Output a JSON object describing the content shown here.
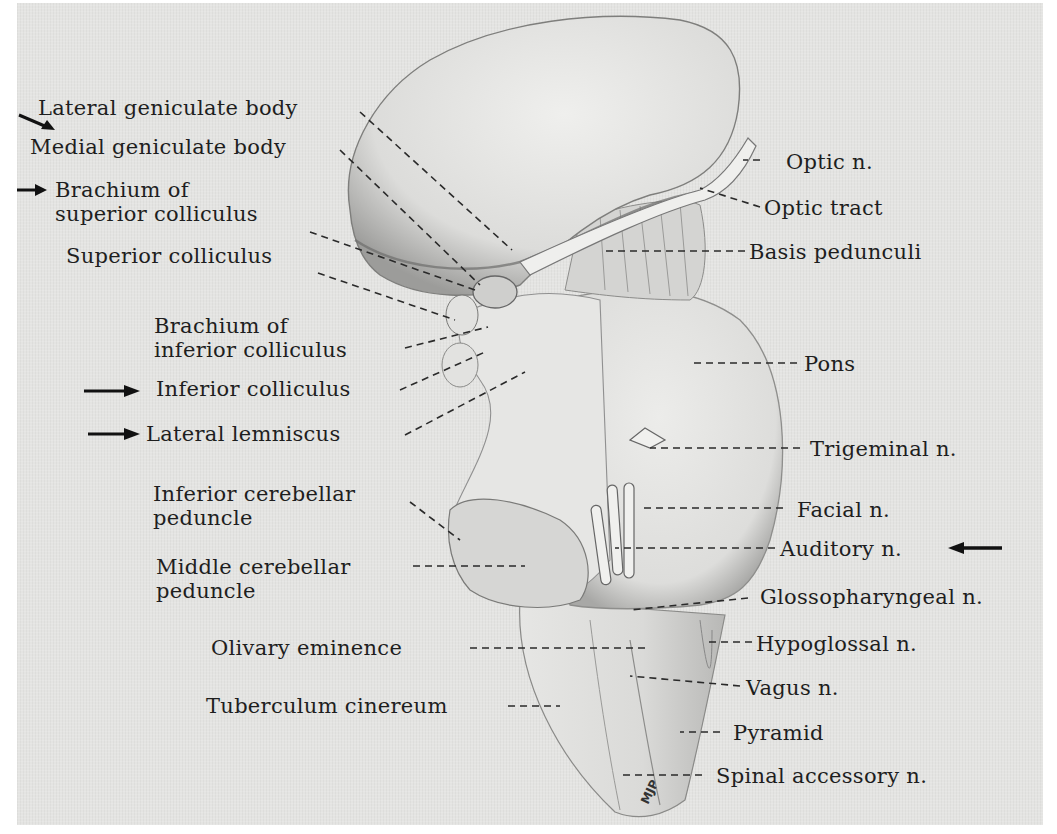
{
  "figure": {
    "signature": "MJP",
    "background_color": "#e4e4e2",
    "ink_color": "#1e1e1e"
  },
  "labels_left": [
    {
      "id": "lateral-geniculate-body",
      "lines": [
        "Lateral geniculate body"
      ],
      "arrow": true
    },
    {
      "id": "medial-geniculate-body",
      "lines": [
        "Medial geniculate body"
      ],
      "arrow": false
    },
    {
      "id": "brachium-superior-colliculus",
      "lines": [
        "Brachium of",
        "superior colliculus"
      ],
      "arrow": true
    },
    {
      "id": "superior-colliculus",
      "lines": [
        "Superior colliculus"
      ],
      "arrow": false
    },
    {
      "id": "brachium-inferior-colliculus",
      "lines": [
        "Brachium of",
        "inferior colliculus"
      ],
      "arrow": false
    },
    {
      "id": "inferior-colliculus",
      "lines": [
        "Inferior colliculus"
      ],
      "arrow": true
    },
    {
      "id": "lateral-lemniscus",
      "lines": [
        "Lateral lemniscus"
      ],
      "arrow": true
    },
    {
      "id": "inferior-cerebellar-peduncle",
      "lines": [
        "Inferior cerebellar",
        "peduncle"
      ],
      "arrow": false
    },
    {
      "id": "middle-cerebellar-peduncle",
      "lines": [
        "Middle cerebellar",
        "peduncle"
      ],
      "arrow": false
    },
    {
      "id": "olivary-eminence",
      "lines": [
        "Olivary eminence"
      ],
      "arrow": false
    },
    {
      "id": "tuberculum-cinereum",
      "lines": [
        "Tuberculum cinereum"
      ],
      "arrow": false
    }
  ],
  "labels_right": [
    {
      "id": "optic-n",
      "lines": [
        "Optic n."
      ],
      "arrow": false
    },
    {
      "id": "optic-tract",
      "lines": [
        "Optic tract"
      ],
      "arrow": false
    },
    {
      "id": "basis-pedunculi",
      "lines": [
        "Basis pedunculi"
      ],
      "arrow": false
    },
    {
      "id": "pons",
      "lines": [
        "Pons"
      ],
      "arrow": false
    },
    {
      "id": "trigeminal-n",
      "lines": [
        "Trigeminal n."
      ],
      "arrow": false
    },
    {
      "id": "facial-n",
      "lines": [
        "Facial n."
      ],
      "arrow": false
    },
    {
      "id": "auditory-n",
      "lines": [
        "Auditory n."
      ],
      "arrow": true
    },
    {
      "id": "glossopharyngeal-n",
      "lines": [
        "Glossopharyngeal n."
      ],
      "arrow": false
    },
    {
      "id": "hypoglossal-n",
      "lines": [
        "Hypoglossal n."
      ],
      "arrow": false
    },
    {
      "id": "vagus-n",
      "lines": [
        "Vagus n."
      ],
      "arrow": false
    },
    {
      "id": "pyramid",
      "lines": [
        "Pyramid"
      ],
      "arrow": false
    },
    {
      "id": "spinal-accessory-n",
      "lines": [
        "Spinal accessory n."
      ],
      "arrow": false
    }
  ]
}
